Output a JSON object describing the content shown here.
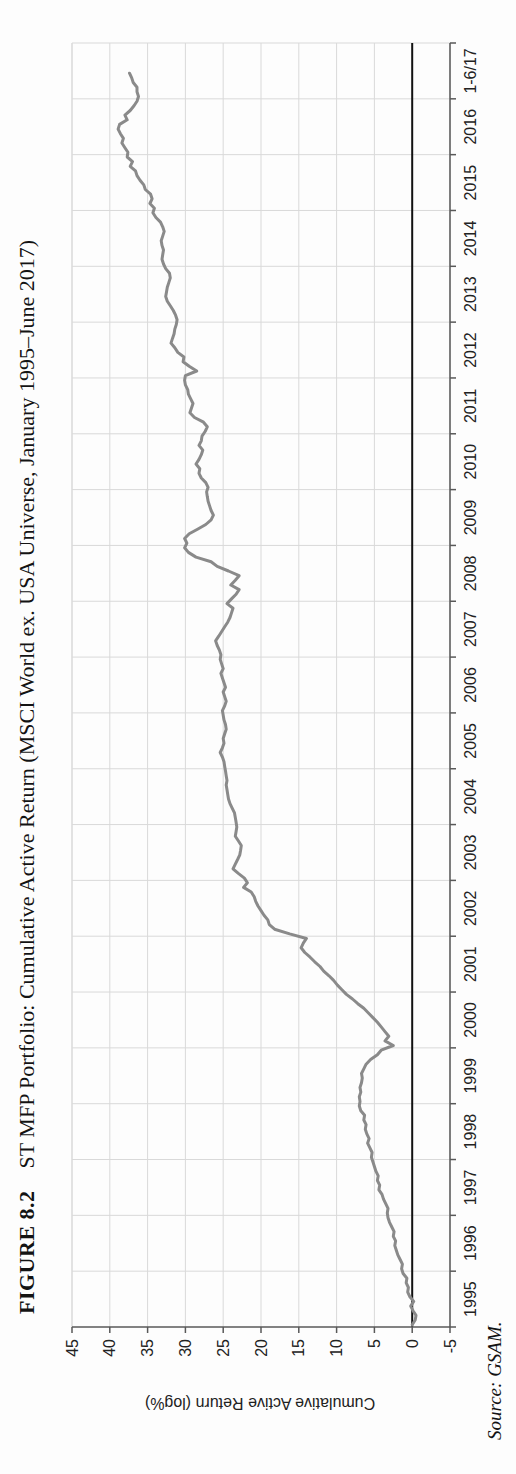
{
  "figure": {
    "number": "FIGURE 8.2",
    "caption": "ST MFP Portfolio: Cumulative Active Return (MSCI World ex. USA Universe, January 1995–June 2017)",
    "source": "Source: GSAM."
  },
  "chart_data": {
    "type": "line",
    "title": "ST MFP Portfolio: Cumulative Active Return (MSCI World ex. USA Universe, January 1995–June 2017)",
    "xlabel": "",
    "ylabel": "Cumulative Active Return (log%)",
    "ylim": [
      -5,
      45
    ],
    "ytick_labels": [
      "45",
      "40",
      "35",
      "30",
      "25",
      "20",
      "15",
      "10",
      "5",
      "0",
      "-5"
    ],
    "yticks": [
      45,
      40,
      35,
      30,
      25,
      20,
      15,
      10,
      5,
      0,
      -5
    ],
    "xtick_labels": [
      "1995",
      "1996",
      "1997",
      "1998",
      "1999",
      "2000",
      "2001",
      "2002",
      "2003",
      "2004",
      "2005",
      "2006",
      "2007",
      "2008",
      "2009",
      "2010",
      "2011",
      "2012",
      "2013",
      "2014",
      "2015",
      "2016",
      "1-6/17"
    ],
    "x_start_year": 1995,
    "x_total_years": 23,
    "grid": true,
    "zero_line": true,
    "legend": "none",
    "colors": {
      "line": "#8a8a8a",
      "grid": "#d9d9d9",
      "axis": "#595959",
      "zero_line": "#111111",
      "text": "#222222"
    },
    "series": [
      {
        "name": "ST MFP cumulative active return (log%)",
        "start": "1995-01",
        "end": "2017-06",
        "frequency": "monthly",
        "values": [
          0.0,
          -0.4,
          -0.5,
          -0.1,
          0.2,
          -0.2,
          0.3,
          0.6,
          0.5,
          0.8,
          0.7,
          1.2,
          1.4,
          1.3,
          1.6,
          1.9,
          2.1,
          2.3,
          2.2,
          2.5,
          2.4,
          2.7,
          3.0,
          3.2,
          3.3,
          3.2,
          3.5,
          3.8,
          4.0,
          4.4,
          4.3,
          4.6,
          4.5,
          4.8,
          5.0,
          5.2,
          5.4,
          5.3,
          5.6,
          5.9,
          5.7,
          6.0,
          6.2,
          6.1,
          6.4,
          6.3,
          6.8,
          7.0,
          6.9,
          7.0,
          6.8,
          6.9,
          6.7,
          6.6,
          6.7,
          6.4,
          6.1,
          5.5,
          4.6,
          4.1,
          2.5,
          3.6,
          3.1,
          3.6,
          4.1,
          4.6,
          5.2,
          5.8,
          6.4,
          7.2,
          7.9,
          8.7,
          9.3,
          9.9,
          10.4,
          11.0,
          11.7,
          12.2,
          12.9,
          13.5,
          14.2,
          14.7,
          14.4,
          14.0,
          16.2,
          18.2,
          18.9,
          19.1,
          19.6,
          20.0,
          20.4,
          20.7,
          20.9,
          21.3,
          22.3,
          21.8,
          22.2,
          23.0,
          23.7,
          23.4,
          23.1,
          22.8,
          22.7,
          22.6,
          23.0,
          23.4,
          23.3,
          23.2,
          23.3,
          23.4,
          23.5,
          23.8,
          24.1,
          24.3,
          24.4,
          24.5,
          24.6,
          24.5,
          24.6,
          24.7,
          24.8,
          24.9,
          25.1,
          25.4,
          25.1,
          24.9,
          25.0,
          24.8,
          24.6,
          24.7,
          24.9,
          25.0,
          25.1,
          24.8,
          24.6,
          24.8,
          25.0,
          24.7,
          24.9,
          25.1,
          25.3,
          25.0,
          25.2,
          25.4,
          25.3,
          25.5,
          25.8,
          26.0,
          25.6,
          25.2,
          24.8,
          24.4,
          24.1,
          23.9,
          23.7,
          24.5,
          23.9,
          23.3,
          22.9,
          24.0,
          23.4,
          22.9,
          24.3,
          25.8,
          26.6,
          28.6,
          29.6,
          30.1,
          29.8,
          30.1,
          29.5,
          28.4,
          27.3,
          26.6,
          26.3,
          26.6,
          26.8,
          27.0,
          27.1,
          27.2,
          27.0,
          27.3,
          27.9,
          28.2,
          28.1,
          28.6,
          28.2,
          27.9,
          27.7,
          28.2,
          27.9,
          27.8,
          27.4,
          27.1,
          27.6,
          28.8,
          29.4,
          29.2,
          29.0,
          29.3,
          29.6,
          29.7,
          30.0,
          30.1,
          30.0,
          28.5,
          29.5,
          30.3,
          30.2,
          31.0,
          31.4,
          31.9,
          31.7,
          31.5,
          31.4,
          31.2,
          31.1,
          31.3,
          31.6,
          32.0,
          32.4,
          32.6,
          32.5,
          32.4,
          32.2,
          32.0,
          32.1,
          32.6,
          32.9,
          33.1,
          33.0,
          32.9,
          33.1,
          33.2,
          33.0,
          32.8,
          33.0,
          33.3,
          33.9,
          34.3,
          34.1,
          34.7,
          34.4,
          34.6,
          35.3,
          35.5,
          36.0,
          36.4,
          36.6,
          37.3,
          37.0,
          37.7,
          37.6,
          38.0,
          38.4,
          38.2,
          38.6,
          38.9,
          38.7,
          37.7,
          38.0,
          37.3,
          36.8,
          36.4,
          36.2,
          36.4,
          36.4,
          36.9,
          37.1,
          37.4
        ]
      }
    ]
  }
}
